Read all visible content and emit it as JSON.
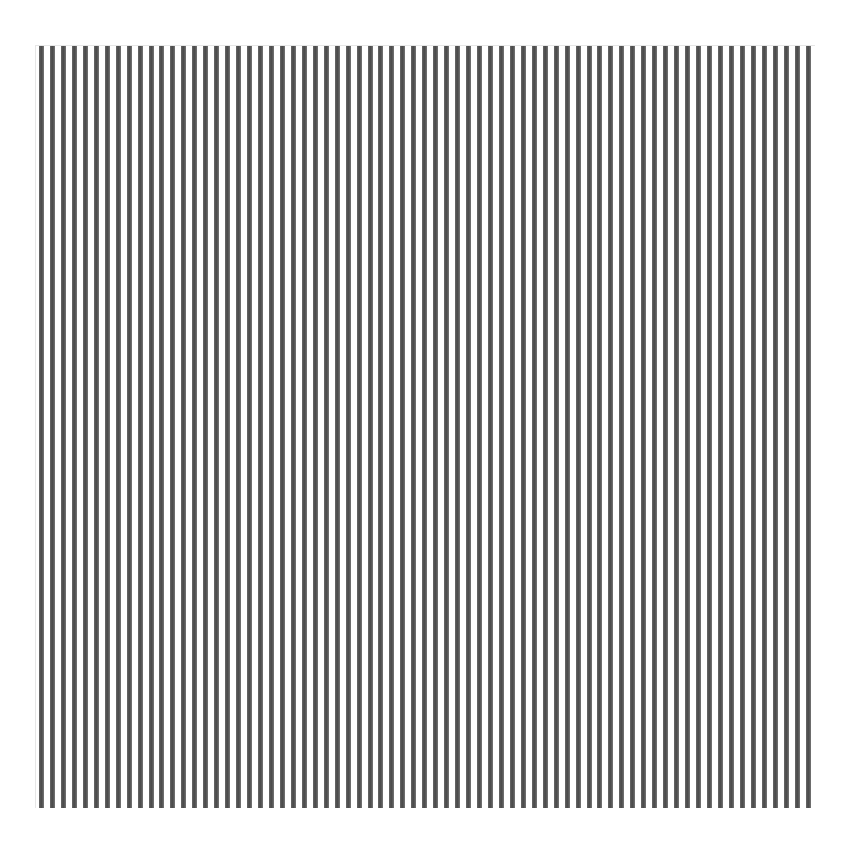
{
  "pattern": {
    "type": "vertical-stripes",
    "stripe_count": 71,
    "stripe_color": "#555555",
    "background_color": "#ffffff",
    "stripe_width_px": 5,
    "period_px": 10.95,
    "bounds": {
      "left": 35,
      "top": 45,
      "right": 815,
      "bottom": 808
    }
  }
}
